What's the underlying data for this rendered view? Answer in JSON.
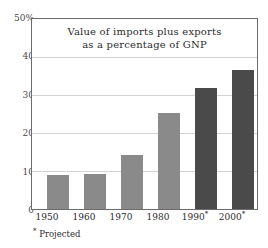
{
  "chart_data": {
    "type": "bar",
    "title": "Value of imports plus exports as a percentage of GNP",
    "title_line1": "Value of imports plus exports",
    "title_line2": "as a percentage of GNP",
    "xlabel": "",
    "ylabel": "",
    "categories": [
      "1950",
      "1960",
      "1970",
      "1980",
      "1990",
      "2000"
    ],
    "tick_labels": [
      "1950",
      "1960",
      "1970",
      "1980",
      "1990 *",
      "2000 *"
    ],
    "values": [
      9.0,
      9.2,
      14.3,
      25.3,
      31.8,
      36.5
    ],
    "ylim": [
      0,
      50
    ],
    "yticks": [
      0,
      10,
      20,
      30,
      40,
      50
    ],
    "ytick_labels": [
      "0",
      "10",
      "20",
      "30",
      "40",
      "50%"
    ],
    "grid": true,
    "legend": "none",
    "projected_flags": [
      false,
      false,
      false,
      false,
      true,
      true
    ],
    "footnote": "* Projected",
    "footnote_marker": "*",
    "footnote_text": "Projected",
    "colors": {
      "bar_actual": "#8a8a8a",
      "bar_projected": "#4a4a4a",
      "gridline": "#d2d2d2",
      "axis": "#6b6b6b",
      "text": "#2b2b2b",
      "background": "#ffffff"
    }
  },
  "axis": {
    "y_labels": [
      {
        "value": 50,
        "text": "50%"
      },
      {
        "value": 40,
        "text": "40"
      },
      {
        "value": 30,
        "text": "30"
      },
      {
        "value": 20,
        "text": "20"
      },
      {
        "value": 10,
        "text": "10"
      },
      {
        "value": 0,
        "text": "0"
      }
    ],
    "x_labels": [
      {
        "year": "1950",
        "star": ""
      },
      {
        "year": "1960",
        "star": ""
      },
      {
        "year": "1970",
        "star": ""
      },
      {
        "year": "1980",
        "star": ""
      },
      {
        "year": "1990",
        "star": "*"
      },
      {
        "year": "2000",
        "star": "*"
      }
    ]
  }
}
